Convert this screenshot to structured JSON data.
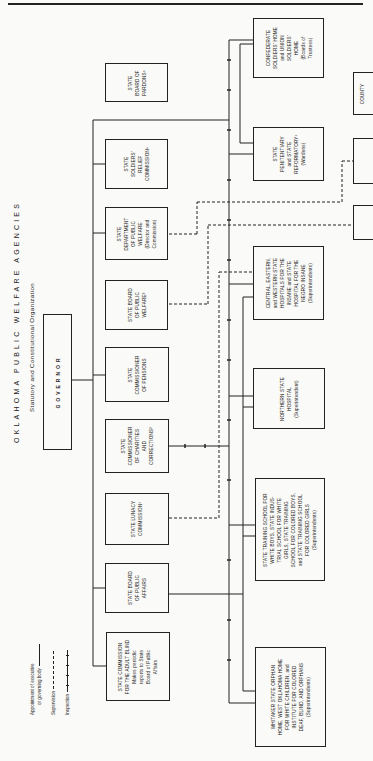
{
  "title": "OKLAHOMA PUBLIC WELFARE AGENCIES",
  "subtitle": "Statutory and Constitutional Organization",
  "legend": {
    "appointment": [
      "Appointment of executive",
      "or governing body"
    ],
    "supervision": "Supervision",
    "inspection": "Inspection"
  },
  "governor": {
    "label": "GOVERNOR"
  },
  "agencies": [
    {
      "id": "pardons",
      "lines": [
        "STATE",
        "BOARD OF",
        "PARDONS⁵"
      ]
    },
    {
      "id": "soldiers_relief",
      "lines": [
        "STATE",
        "SOLDIERS'",
        "RELIEF",
        "COMMISSION⁶"
      ]
    },
    {
      "id": "dept_public_welfare",
      "lines": [
        "STATE",
        "DEPARTMENT",
        "OF PUBLIC",
        "WELFARE",
        "(Director and",
        "Commission)"
      ]
    },
    {
      "id": "board_public_welfare",
      "lines": [
        "STATE BOARD",
        "OF PUBLIC",
        "WELFARE³"
      ]
    },
    {
      "id": "commissioner_pensions",
      "lines": [
        "STATE",
        "COMMISSIONER",
        "OF PENSIONS"
      ]
    },
    {
      "id": "charities_corrections",
      "lines": [
        "STATE",
        "COMMISSIONER",
        "OF CHARITIES",
        "AND",
        "CORRECTIONS²"
      ]
    },
    {
      "id": "lunacy",
      "lines": [
        "STATE LUNACY",
        "COMMISSION¹"
      ]
    },
    {
      "id": "board_public_affairs",
      "lines": [
        "STATE BOARD",
        "OF PUBLIC",
        "AFFAIRS"
      ]
    },
    {
      "id": "adult_blind",
      "lines": [
        "STATE COMMISSION",
        "FOR THE ADULT BLIND",
        "Makes periodic",
        "reports to State",
        "Board of Public",
        "Affairs"
      ]
    }
  ],
  "institutions": [
    {
      "id": "confederate_home",
      "lines": [
        "CONFEDERATE",
        "SOLDIERS' HOME",
        "and UNION",
        "SOLDIERS'",
        "HOME",
        "(Boards of",
        "Trustees)"
      ]
    },
    {
      "id": "penitentiary",
      "lines": [
        "STATE",
        "PENITENTIARY",
        "and STATE",
        "REFORMATORY⁴",
        "(Wardens)"
      ]
    },
    {
      "id": "hospitals",
      "lines": [
        "CENTRAL, EASTERN,",
        "and WESTERN STATE",
        "HOSPITALS FOR THE",
        "INSANE and STATE",
        "HOSPITAL FOR THE",
        "NEGRO INSANE",
        "(Superintendents)"
      ]
    },
    {
      "id": "northern_hospital",
      "lines": [
        "NORTHERN STATE",
        "HOSPITAL",
        "(Superintendent)"
      ]
    },
    {
      "id": "training_schools",
      "lines": [
        "STATE TRAINING SCHOOL FOR",
        "WHITE BOYS, STATE INDUS-",
        "TRIAL SCHOOL FOR WHITE",
        "GIRLS, STATE TRAINING",
        "SCHOOL FOR COLORED BOYS,",
        "and STATE TRAINING SCHOOL",
        "FOR COLORED GIRLS",
        "(Superintendents)"
      ]
    },
    {
      "id": "orphan_homes",
      "lines": [
        "WHITAKER STATE ORPHAN",
        "HOME, WEST OKLAHOMA HOME",
        "FOR WHITE CHILDREN, and",
        "INSTITUTE FOR COLORED",
        "DEAF, BLIND, AND ORPHANS",
        "(Superintendents)"
      ]
    }
  ],
  "county": [
    {
      "id": "county_1",
      "lines": [
        "COUNTY"
      ]
    },
    {
      "id": "county_2",
      "lines": [
        ""
      ]
    },
    {
      "id": "county_3",
      "lines": [
        ""
      ]
    }
  ]
}
